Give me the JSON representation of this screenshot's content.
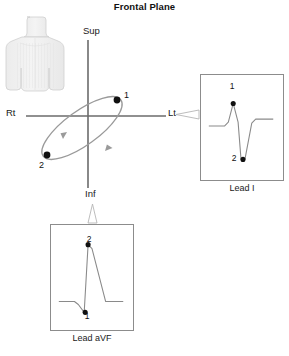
{
  "title": "Frontal Plane",
  "axes": {
    "superior": "Sup",
    "inferior": "Inf",
    "right": "Rt",
    "left": "Lt"
  },
  "loop": {
    "point1_label": "1",
    "point2_label": "2",
    "description": "QRS vector loop in frontal plane",
    "point1_position": {
      "x": 117,
      "y": 100
    },
    "point2_position": {
      "x": 47,
      "y": 155
    },
    "direction": "clockwise"
  },
  "leads": [
    {
      "id": "lead-i",
      "caption": "Lead I",
      "point_top_label": "1",
      "point_bottom_label": "2",
      "morphology": "small positive R wave then deep negative S wave"
    },
    {
      "id": "lead-avf",
      "caption": "Lead aVF",
      "point_top_label": "2",
      "point_bottom_label": "1",
      "morphology": "small negative deflection then tall positive R wave"
    }
  ],
  "figure": {
    "torso_label": "anatomical torso frontal view"
  },
  "colors": {
    "axis": "#6b6b6b",
    "loop": "#9a9a9a",
    "point": "#111111",
    "box_border": "#8c8c8c",
    "torso_fill": "#f0f0f0",
    "torso_stroke": "#cfcfcf",
    "text": "#1a1a1a",
    "trace": "#8a8a8a"
  }
}
